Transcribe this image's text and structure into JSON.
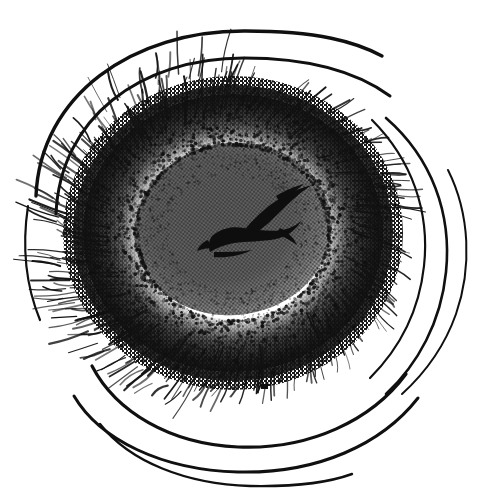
{
  "document": {
    "kind": "scanned-ink-illustration",
    "title": "Concentric eye-like ink drawing",
    "alt_text": "A black and white pen-and-ink drawing of a roughly circular eye-like form: concentric sweeping arcs on the outside, dense radial feathering strokes, a heavy dark stippled ring, a mid-gray halftone core, and a small dark bird-shaped mark near the center.",
    "width_px": 488,
    "height_px": 498
  },
  "canvas": {
    "background_color": "#ffffff",
    "ink_color": "#0b0b0b",
    "core_gray": "#888888",
    "core_gray_inner": "#7e7e7e",
    "ring_dark": "#1a1a1a",
    "halftone_light": "#9a9a9a"
  },
  "composition": {
    "center_x": 233,
    "center_y": 233,
    "layers": [
      {
        "id": "outer-arcs",
        "label": "Outer sweeping contour arcs",
        "stroke_color": "#111111",
        "count": 6
      },
      {
        "id": "feather-hatching",
        "label": "Radial feathering / hatching strokes",
        "stroke_color": "#141414",
        "count": 420
      },
      {
        "id": "dark-ring",
        "label": "Dense dark stippled ring",
        "fill_color": "#141414"
      },
      {
        "id": "gray-core",
        "label": "Mid-gray halftone core",
        "fill_color": "#888888",
        "rx": 97,
        "ry": 84
      },
      {
        "id": "center-mark",
        "label": "Central dark bird-shaped mark",
        "fill_color": "#101010",
        "x": 248,
        "y": 222
      },
      {
        "id": "speck",
        "label": "Isolated ink speck",
        "x": 264,
        "y": 386
      }
    ]
  },
  "outer_arcs": [
    {
      "name": "arc-top-outer",
      "d": "M 36 196 C 40 96 132 30 246 31 C 318 31 356 42 382 56",
      "w": 3.4
    },
    {
      "name": "arc-top-second",
      "d": "M 56 214 C 60 118 140 58 244 58 C 316 58 360 74 390 96",
      "w": 3.0
    },
    {
      "name": "arc-right-outer",
      "d": "M 386 118 C 432 158 452 214 446 272 C 441 322 418 364 386 394",
      "w": 2.6
    },
    {
      "name": "arc-right-inner",
      "d": "M 372 120 C 412 160 430 212 424 266 C 419 312 398 350 370 378",
      "w": 2.2
    },
    {
      "name": "arc-right-thin",
      "d": "M 448 170 C 470 214 472 268 456 314 C 444 348 424 374 402 394",
      "w": 2.0
    },
    {
      "name": "arc-bottom-1",
      "d": "M 92 366 C 116 412 170 444 238 447 C 310 450 372 420 406 374",
      "w": 3.2
    },
    {
      "name": "arc-bottom-2",
      "d": "M 74 396 C 100 440 162 470 238 472 C 318 474 382 444 418 398",
      "w": 3.0
    },
    {
      "name": "arc-bottom-3",
      "d": "M 100 424 C 130 462 186 484 250 486 C 300 487 330 482 352 474",
      "w": 2.4
    },
    {
      "name": "arc-left-outer",
      "d": "M 28 206 C 22 246 26 286 40 320",
      "w": 2.2
    }
  ],
  "hatch_bands": [
    {
      "name": "band-upper-left",
      "a0": 170,
      "a1": 268,
      "r0": 108,
      "r1": 178,
      "count": 120,
      "len": 34,
      "w": 1.5
    },
    {
      "name": "band-upper-right",
      "a0": 268,
      "a1": 352,
      "r0": 104,
      "r1": 158,
      "count": 96,
      "len": 26,
      "w": 1.3
    },
    {
      "name": "band-lower-left",
      "a0": 100,
      "a1": 172,
      "r0": 104,
      "r1": 176,
      "count": 110,
      "len": 32,
      "w": 1.5
    },
    {
      "name": "band-lower-right",
      "a0": 20,
      "a1": 100,
      "r0": 100,
      "r1": 158,
      "count": 100,
      "len": 26,
      "w": 1.3
    },
    {
      "name": "band-right-edge",
      "a0": 340,
      "a1": 380,
      "r0": 100,
      "r1": 150,
      "count": 46,
      "len": 24,
      "w": 1.2
    }
  ],
  "center_mark_paths": [
    "M 212 236 C 222 228 232 226 244 228 C 258 230 272 232 282 230 C 292 228 298 224 302 220 C 296 230 288 236 276 239 C 262 242 246 241 234 243 C 224 245 216 248 210 252 C 208 246 209 240 212 236 Z",
    "M 246 228 C 258 214 272 202 288 194 C 300 188 308 186 312 185 C 304 190 294 198 285 207 C 274 218 264 228 254 234 Z",
    "M 276 196 C 286 190 296 186 304 184 C 296 190 288 197 281 204 Z",
    "M 280 228 C 288 232 294 238 297 245 C 290 240 283 236 276 234 Z",
    "M 208 240 C 203 242 199 246 197 251 C 202 249 207 248 212 248 Z",
    "M 214 252 C 226 252 240 252 252 250 C 240 256 226 258 214 257 Z"
  ],
  "inner_contours": [
    {
      "name": "core-contour-1",
      "cx": 233,
      "cy": 231,
      "rx": 86,
      "ry": 74,
      "rot": -8
    },
    {
      "name": "core-contour-2",
      "cx": 235,
      "cy": 236,
      "rx": 68,
      "ry": 58,
      "rot": -8
    },
    {
      "name": "core-contour-3",
      "cx": 238,
      "cy": 240,
      "rx": 48,
      "ry": 40,
      "rot": -6
    }
  ],
  "labels": {
    "figure_caption": "",
    "visible_text": []
  }
}
